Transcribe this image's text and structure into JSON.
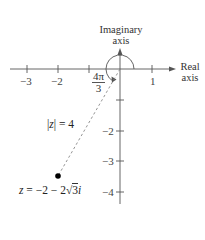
{
  "diagram": {
    "axes": {
      "x_label_line1": "Real",
      "x_label_line2": "axis",
      "y_label_line1": "Imaginary",
      "y_label_line2": "axis",
      "x_ticks": [
        {
          "value": -3,
          "label": "−3"
        },
        {
          "value": -2,
          "label": "−2"
        },
        {
          "value": -1,
          "label": ""
        },
        {
          "value": 1,
          "label": "1"
        }
      ],
      "y_ticks": [
        {
          "value": -1,
          "label": ""
        },
        {
          "value": -2,
          "label": "−2"
        },
        {
          "value": -3,
          "label": "−3"
        },
        {
          "value": -4,
          "label": "−4"
        }
      ]
    },
    "angle_label": {
      "numerator": "4π",
      "denominator": "3"
    },
    "modulus_label": {
      "left_bar": "|",
      "var": "z",
      "right_bar": "|",
      "rest": " = 4"
    },
    "point_label": {
      "var": "z",
      "rest_a": " = −2 − 2",
      "radicand": "3",
      "imag": "i"
    },
    "point": {
      "re": -2,
      "im": -3.464
    },
    "colors": {
      "axis": "#555555",
      "dashed": "#888888",
      "point": "#000000"
    }
  }
}
